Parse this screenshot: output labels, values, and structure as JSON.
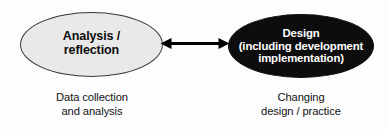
{
  "diagram": {
    "background_color": "#fdfdfd",
    "nodes": {
      "analysis": {
        "name": "Analysis / reflection",
        "line1": "Analysis /",
        "line2": "reflection",
        "fill_color": "#e9e9e9",
        "stroke_color": "#3a3a3a",
        "text_color": "#0b0b0b",
        "caption_line1": "Data collection",
        "caption_line2": "and analysis"
      },
      "design": {
        "name": "Design (including development implementation)",
        "line1": "Design",
        "line2": "(including development",
        "line3": "implementation)",
        "fill_color": "#0d0d0d",
        "stroke_color": "#0d0d0d",
        "text_color": "#ffffff",
        "caption_line1": "Changing",
        "caption_line2": "design / practice"
      }
    },
    "connector": {
      "name": "double-headed-arrow",
      "style": "bidirectional",
      "color": "#000000",
      "from": "analysis",
      "to": "design"
    }
  }
}
